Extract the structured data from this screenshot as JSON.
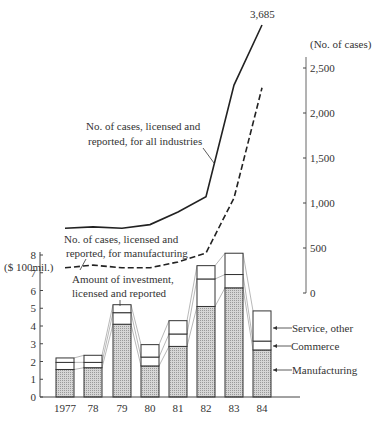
{
  "chart_data": [
    {
      "type": "bar",
      "stacked": true,
      "title": "Amount of investment, licensed and reported",
      "ylabel": "($ 100mil.)",
      "ylim": [
        0,
        8
      ],
      "yticks": [
        "0",
        "1",
        "2",
        "3",
        "4",
        "5",
        "6",
        "7",
        "8"
      ],
      "categories": [
        "1977",
        "78",
        "79",
        "80",
        "81",
        "82",
        "83",
        "84"
      ],
      "series": [
        {
          "name": "Manufacturing",
          "values": [
            1.55,
            1.65,
            4.1,
            1.75,
            2.85,
            5.1,
            6.15,
            2.65
          ]
        },
        {
          "name": "Commerce",
          "values": [
            0.4,
            0.3,
            0.65,
            0.5,
            0.7,
            1.55,
            0.75,
            0.5
          ]
        },
        {
          "name": "Service, other",
          "values": [
            0.25,
            0.4,
            0.45,
            0.7,
            0.75,
            0.75,
            1.2,
            1.7
          ]
        }
      ]
    },
    {
      "type": "line",
      "ylabel": "(No. of cases)",
      "ylim": [
        0,
        2500
      ],
      "yticks": [
        "0",
        "500",
        "1,000",
        "1,500",
        "2,000",
        "2,500"
      ],
      "categories": [
        "1977",
        "78",
        "79",
        "80",
        "81",
        "82",
        "83",
        "84"
      ],
      "series": [
        {
          "name": "No. of cases, licensed and reported, for all industries",
          "style": "solid",
          "values": [
            720,
            735,
            720,
            760,
            900,
            1070,
            2310,
            3685
          ]
        },
        {
          "name": "No. of cases, licensed and reported, for manufacturing",
          "style": "dashed",
          "values": [
            280,
            310,
            280,
            280,
            345,
            445,
            1055,
            2280
          ]
        }
      ],
      "annotations": [
        "3,685"
      ]
    }
  ],
  "labels": {
    "left_axis_unit": "($ 100mil.)",
    "right_axis_unit": "(No. of cases)",
    "peak_value": "3,685",
    "all_ind_line1": "No. of cases, licensed and",
    "all_ind_line2": "reported, for all industries",
    "manuf_line1": "No. of cases, licensed and",
    "manuf_line2": "reported, for manufacturing",
    "invest_line1": "Amount of investment,",
    "invest_line2": "licensed and reported",
    "legend_service": "Service, other",
    "legend_commerce": "Commerce",
    "legend_manufacturing": "Manufacturing"
  }
}
